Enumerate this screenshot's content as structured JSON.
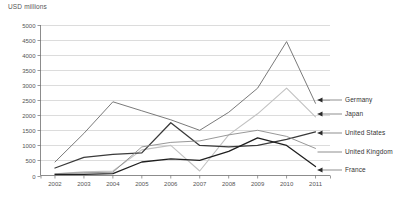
{
  "chart_data": {
    "type": "line",
    "title": "USD millions",
    "xlabel": "",
    "ylabel": "USD millions",
    "grid": true,
    "legend_position": "right-inline-callouts",
    "ylim": [
      0,
      5000
    ],
    "ytick_step": 500,
    "yticks": [
      "0",
      "500",
      "1000",
      "1500",
      "2000",
      "2500",
      "3000",
      "3500",
      "4000",
      "4500",
      "5000"
    ],
    "categories": [
      "2002",
      "2003",
      "2004",
      "2005",
      "2006",
      "2007",
      "2008",
      "2009",
      "2010",
      "2011"
    ],
    "x": [
      2002,
      2003,
      2004,
      2005,
      2006,
      2007,
      2008,
      2009,
      2010,
      2011
    ],
    "series": [
      {
        "name": "Germany",
        "color": "#6b6b6b",
        "width": 0.9,
        "values": [
          450,
          1400,
          2450,
          2150,
          1850,
          1500,
          2100,
          2900,
          4450,
          2400
        ]
      },
      {
        "name": "Japan",
        "color": "#c2c2c2",
        "width": 1.1,
        "values": [
          60,
          120,
          150,
          850,
          1000,
          150,
          1350,
          2050,
          2900,
          1950
        ]
      },
      {
        "name": "United States",
        "color": "#3a3a3a",
        "width": 1.3,
        "values": [
          250,
          600,
          700,
          750,
          1750,
          1000,
          950,
          1000,
          1200,
          1450
        ]
      },
      {
        "name": "United Kingdom",
        "color": "#8c8c8c",
        "width": 0.9,
        "values": [
          60,
          90,
          110,
          950,
          1100,
          1150,
          1350,
          1500,
          1300,
          900
        ]
      },
      {
        "name": "France",
        "color": "#1f1f1f",
        "width": 1.3,
        "values": [
          30,
          40,
          60,
          450,
          550,
          500,
          800,
          1250,
          1000,
          300
        ]
      }
    ],
    "callouts": [
      {
        "label": "Germany",
        "value": 2400
      },
      {
        "label": "Japan",
        "value": 1950
      },
      {
        "label": "United States",
        "value": 1450
      },
      {
        "label": "United Kingdom",
        "value": 900
      },
      {
        "label": "France",
        "value": 300
      }
    ]
  }
}
